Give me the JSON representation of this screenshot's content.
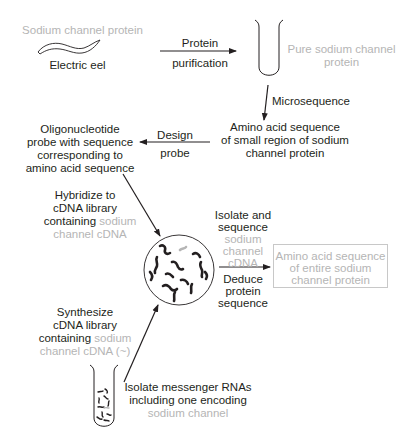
{
  "colors": {
    "text": "#231f20",
    "highlight": "#b5b5b5",
    "arrow": "#231f20"
  },
  "nodes": {
    "source_protein": {
      "label": "Sodium channel protein"
    },
    "electric_eel": {
      "label": "Electric eel"
    },
    "pure_protein": {
      "line1": "Pure sodium channel",
      "line2": "protein"
    },
    "amino_small": {
      "line1": "Amino acid sequence",
      "line2": "of small region of sodium",
      "line3": "channel protein"
    },
    "oligo_probe": {
      "line1": "Oligonucleotide",
      "line2": "probe with sequence",
      "line3": "corresponding to",
      "line4": "amino acid sequence"
    },
    "amino_entire": {
      "line1": "Amino acid sequence",
      "line2": "of entire sodium",
      "line3": "channel protein"
    },
    "mrna": {
      "line1": "Isolate messenger RNAs",
      "line2": "including one encoding",
      "line3": "sodium channel"
    }
  },
  "steps": {
    "protein_purification": {
      "line1": "Protein",
      "line2": "purification"
    },
    "microsequence": {
      "label": "Microsequence"
    },
    "design_probe": {
      "line1": "Design",
      "line2": "probe"
    },
    "hybridize": {
      "line1": "Hybridize to",
      "line2": "cDNA library",
      "line3a": "containing",
      "line3b": "sodium",
      "line4": "channel cDNA"
    },
    "isolate_sequence": {
      "line1": "Isolate and",
      "line2": "sequence",
      "line3": "sodium",
      "line4": "channel",
      "line5": "cDNA"
    },
    "deduce": {
      "line1": "Deduce",
      "line2": "protein",
      "line3": "sequence"
    },
    "synthesize": {
      "line1": "Synthesize",
      "line2": "cDNA library",
      "line3a": "containing",
      "line3b": "sodium",
      "line4": "channel cDNA (~)"
    }
  },
  "icons": [
    "eel-icon",
    "test-tube-icon",
    "cdna-library-dish-icon",
    "mrna-test-tube-icon",
    "arrow-icon"
  ]
}
